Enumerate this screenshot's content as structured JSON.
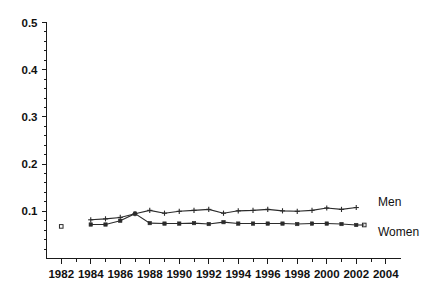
{
  "chart_data": {
    "type": "line",
    "title": "",
    "subtitle": "",
    "xlabel": "",
    "ylabel": "",
    "xlim": [
      1981,
      2005
    ],
    "ylim": [
      0.0,
      0.5
    ],
    "grid": false,
    "legend_position": "right-inline",
    "x_ticks": [
      1982,
      1984,
      1986,
      1988,
      1990,
      1992,
      1994,
      1996,
      1998,
      2000,
      2002,
      2004
    ],
    "x_tick_labels": [
      "1982",
      "1984",
      "1986",
      "1988",
      "1990",
      "1992",
      "1994",
      "1996",
      "1998",
      "2000",
      "2002",
      "2004"
    ],
    "x_minor_ticks": [
      1983,
      1985,
      1987,
      1989,
      1991,
      1993,
      1995,
      1997,
      1999,
      2001,
      2003
    ],
    "y_ticks": [
      0.1,
      0.2,
      0.3,
      0.4,
      0.5
    ],
    "y_tick_labels": [
      "0.1",
      "0.2",
      "0.3",
      "0.4",
      "0.5"
    ],
    "y_minor_ticks": [
      0.02,
      0.04,
      0.06,
      0.08,
      0.12,
      0.14,
      0.16,
      0.18,
      0.22,
      0.24,
      0.26,
      0.28,
      0.32,
      0.34,
      0.36,
      0.38,
      0.42,
      0.44,
      0.46,
      0.48
    ],
    "series": [
      {
        "name": "Men",
        "marker": "plus",
        "color": "#2b2b2b",
        "x": [
          1984,
          1985,
          1986,
          1987,
          1988,
          1989,
          1990,
          1991,
          1992,
          1993,
          1994,
          1995,
          1996,
          1997,
          1998,
          1999,
          2000,
          2001,
          2002
        ],
        "values": [
          0.082,
          0.084,
          0.087,
          0.095,
          0.102,
          0.096,
          0.1,
          0.102,
          0.104,
          0.096,
          0.101,
          0.102,
          0.104,
          0.101,
          0.1,
          0.102,
          0.107,
          0.104,
          0.108
        ]
      },
      {
        "name": "Women",
        "marker": "square-filled",
        "color": "#2b2b2b",
        "x": [
          1984,
          1985,
          1986,
          1987,
          1988,
          1989,
          1990,
          1991,
          1992,
          1993,
          1994,
          1995,
          1996,
          1997,
          1998,
          1999,
          2000,
          2001,
          2002
        ],
        "values": [
          0.072,
          0.072,
          0.08,
          0.095,
          0.075,
          0.074,
          0.074,
          0.075,
          0.073,
          0.077,
          0.074,
          0.074,
          0.074,
          0.074,
          0.073,
          0.074,
          0.074,
          0.073,
          0.071
        ]
      },
      {
        "name": "isolated-1982",
        "marker": "square-open",
        "color": "#2b2b2b",
        "x": [
          1982
        ],
        "values": [
          0.068
        ]
      }
    ],
    "legend": [
      {
        "label": "Men",
        "marker": "plus"
      },
      {
        "label": "Women",
        "marker": "square-filled"
      }
    ]
  }
}
